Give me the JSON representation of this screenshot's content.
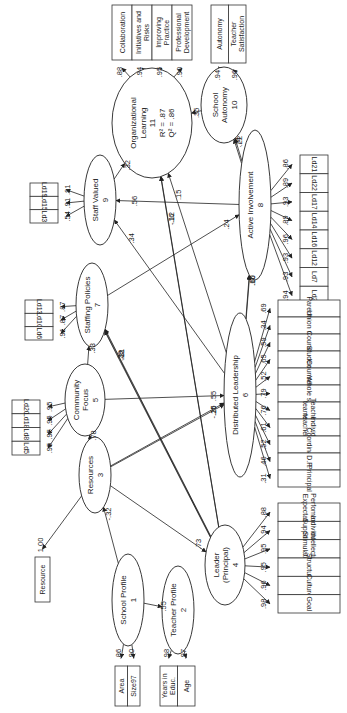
{
  "diagram": {
    "type": "path-model",
    "orientation": "rotated-90-ccw",
    "latents": [
      {
        "id": "n1",
        "name": "School Profile",
        "num": "1",
        "cx": 128,
        "cy": 600,
        "rx": 16,
        "ry": 46
      },
      {
        "id": "n2",
        "name": "Teacher Profile",
        "num": "2",
        "cx": 178,
        "cy": 610,
        "rx": 16,
        "ry": 44
      },
      {
        "id": "n3",
        "name": "Resources",
        "num": "3",
        "cx": 95,
        "cy": 475,
        "rx": 16,
        "ry": 38
      },
      {
        "id": "n4",
        "name": "Leader\n(Principal)",
        "num": "4",
        "cx": 225,
        "cy": 565,
        "rx": 20,
        "ry": 40
      },
      {
        "id": "n5",
        "name": "Community\nFocus",
        "num": "5",
        "cx": 85,
        "cy": 400,
        "rx": 20,
        "ry": 36
      },
      {
        "id": "n6",
        "name": "Distributed Leadership",
        "num": "6",
        "cx": 240,
        "cy": 395,
        "rx": 16,
        "ry": 82
      },
      {
        "id": "n7",
        "name": "Staffing Policies",
        "num": "7",
        "cx": 92,
        "cy": 305,
        "rx": 16,
        "ry": 42
      },
      {
        "id": "n8",
        "name": "Active Involvement",
        "num": "8",
        "cx": 255,
        "cy": 205,
        "rx": 16,
        "ry": 75
      },
      {
        "id": "n9",
        "name": "Staff Valued",
        "num": "9",
        "cx": 100,
        "cy": 200,
        "rx": 16,
        "ry": 45
      },
      {
        "id": "n10",
        "name": "School\nAutonomy",
        "num": "10",
        "cx": 224,
        "cy": 105,
        "rx": 23,
        "ry": 38
      },
      {
        "id": "n11",
        "name": "Organizational\nLearning",
        "num": "11",
        "cx": 152,
        "cy": 123,
        "rx": 40,
        "ry": 55,
        "r2": "R² = .87",
        "q2": "Q² = .86"
      }
    ],
    "indicator_groups": [
      {
        "latent": "n11",
        "x": 112,
        "y": 5,
        "w": 80,
        "h": 55,
        "items": [
          "Collaboration",
          "Initiatives and Risks",
          "Improving Practice",
          "Professional Development"
        ],
        "loadings": [
          ".88",
          ".94",
          ".95",
          ".90"
        ]
      },
      {
        "latent": "n10",
        "x": 211,
        "y": 5,
        "w": 35,
        "h": 58,
        "items": [
          "Autonomy",
          "Teacher Satisfaction"
        ],
        "loadings": [
          ".94",
          ".96"
        ]
      },
      {
        "latent": "n8",
        "x": 300,
        "y": 155,
        "w": 28,
        "h": 150,
        "items": [
          "Ld21",
          "Ld22",
          "Ld17",
          "Ld14",
          "Ld16",
          "Ld12",
          "Ld7",
          "Ld2"
        ],
        "loadings": [
          ".86",
          ".89",
          ".93",
          ".89",
          ".96",
          ".93",
          ".93",
          ".94"
        ]
      },
      {
        "latent": "n9",
        "x": 30,
        "y": 183,
        "w": 28,
        "h": 40,
        "items": [
          "Ld19",
          "Ld15",
          "Ld3"
        ],
        "loadings": [
          ".91",
          ".91",
          ".54"
        ]
      },
      {
        "latent": "n7",
        "x": 25,
        "y": 300,
        "w": 28,
        "h": 40,
        "items": [
          "Ld13",
          "Ld10",
          "Ld6"
        ],
        "loadings": [
          ".87",
          ".87",
          ".91"
        ]
      },
      {
        "latent": "n5",
        "x": 12,
        "y": 400,
        "w": 28,
        "h": 55,
        "items": [
          "Ld20",
          "Ld18",
          "Ld8",
          "Ld5"
        ],
        "loadings": [
          ".95",
          ".95",
          ".95",
          ".95"
        ]
      },
      {
        "latent": "n6",
        "x": 278,
        "y": 300,
        "w": 62,
        "h": 187,
        "items": [
          "Parents",
          "Union rep",
          "Council",
          "Students",
          "Counsellor",
          "Whole staff",
          "Teacher teams",
          "Individ. teachers",
          "Coordinato",
          "D.P.",
          "Principal"
        ],
        "loadings": [
          ".69",
          ".34",
          ".59",
          ".65",
          ".52",
          ".79",
          ".76",
          ".61",
          ".52",
          ".46",
          ".31"
        ]
      },
      {
        "latent": "n4",
        "x": 278,
        "y": 503,
        "w": 62,
        "h": 110,
        "items": [
          "Perfomance Expectation",
          "Individual Support",
          "Intellectual Stimulation",
          "Structure",
          "Culture",
          "Goal"
        ],
        "loadings": [
          ".88",
          ".94",
          ".95",
          ".95",
          ".96",
          ".98"
        ]
      },
      {
        "latent": "n3",
        "x": 35,
        "y": 557,
        "w": 15,
        "h": 45,
        "items": [
          "Resource"
        ],
        "loadings": [
          "1.00"
        ]
      },
      {
        "latent": "n1",
        "x": 115,
        "y": 666,
        "w": 25,
        "h": 40,
        "items": [
          "Area",
          "Size97"
        ],
        "loadings": [
          ".86",
          ".90"
        ]
      },
      {
        "latent": "n2",
        "x": 160,
        "y": 666,
        "w": 35,
        "h": 40,
        "items": [
          "Years in Educ.",
          "Age"
        ],
        "loadings": [
          ".98",
          ".97"
        ]
      }
    ],
    "paths": [
      {
        "from": "n1",
        "to": "n3",
        "coef": "-.32"
      },
      {
        "from": "n1",
        "to": "n2",
        "coef": ".55"
      },
      {
        "from": "n3",
        "to": "n4",
        "coef": ".73"
      },
      {
        "from": "n3",
        "to": "n5",
        "coef": ".78"
      },
      {
        "from": "n3",
        "to": "n6",
        "coef": ".25"
      },
      {
        "from": "n3",
        "to": "n6",
        "coef": "-.16"
      },
      {
        "from": "n4",
        "to": "n7",
        "coef": ".31"
      },
      {
        "from": "n4",
        "to": "n7",
        "coef": ".12"
      },
      {
        "from": "n4",
        "to": "n7",
        "coef": ".29"
      },
      {
        "from": "n5",
        "to": "n6",
        "coef": ".55"
      },
      {
        "from": "n5",
        "to": "n7",
        "coef": ".33"
      },
      {
        "from": "n6",
        "to": "n8",
        "coef": ".60"
      },
      {
        "from": "n6",
        "to": "n8",
        "coef": ".16"
      },
      {
        "from": "n7",
        "to": "n8",
        "coef": ".24"
      },
      {
        "from": "n6",
        "to": "n9",
        "coef": ".34"
      },
      {
        "from": "n8",
        "to": "n9",
        "coef": ".56"
      },
      {
        "from": "n9",
        "to": "n11",
        "coef": ".32"
      },
      {
        "from": "n4",
        "to": "n11",
        "coef": "-.12"
      },
      {
        "from": "n4",
        "to": "n11",
        "coef": ".16"
      },
      {
        "from": "n6",
        "to": "n11",
        "coef": ".15"
      },
      {
        "from": "n8",
        "to": "n10",
        "coef": ".22"
      },
      {
        "from": "n8",
        "to": "n10",
        "coef": ".74"
      },
      {
        "from": "n10",
        "to": "n11",
        "coef": ".35"
      }
    ]
  }
}
